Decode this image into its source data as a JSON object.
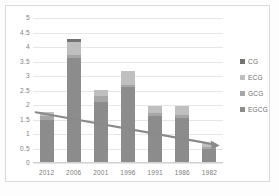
{
  "chart_data": {
    "type": "bar",
    "stacked": true,
    "title": "",
    "xlabel": "",
    "ylabel": "",
    "categories": [
      "2012",
      "2006",
      "2001",
      "1996",
      "1991",
      "1986",
      "1982"
    ],
    "series": [
      {
        "name": "EGCG",
        "color": "#8c8c8c",
        "values": [
          1.5,
          3.62,
          2.12,
          2.62,
          1.62,
          1.55,
          0.47
        ]
      },
      {
        "name": "GCG",
        "color": "#a6a6a6",
        "values": [
          0.12,
          0.12,
          0.18,
          0.08,
          0.1,
          0.12,
          0.08
        ]
      },
      {
        "name": "ECG",
        "color": "#bfbfbf",
        "values": [
          0.15,
          0.45,
          0.22,
          0.46,
          0.26,
          0.28,
          0.14
        ]
      },
      {
        "name": "CG",
        "color": "#737373",
        "values": [
          0.0,
          0.08,
          0.0,
          0.0,
          0.0,
          0.0,
          0.0
        ]
      }
    ],
    "totals": [
      1.77,
      4.27,
      2.52,
      3.16,
      1.98,
      1.95,
      0.69
    ],
    "ylim": [
      0,
      5
    ],
    "yticks": [
      "0",
      "0.5",
      "1",
      "1.5",
      "2",
      "2.5",
      "3",
      "3.5",
      "4",
      "4.5",
      "5"
    ],
    "ytick_values": [
      0,
      0.5,
      1,
      1.5,
      2,
      2.5,
      3,
      3.5,
      4,
      4.5,
      5
    ],
    "grid": true,
    "legend_position": "right",
    "legend": [
      {
        "label": "CG",
        "color": "#737373"
      },
      {
        "label": "ECG",
        "color": "#bfbfbf"
      },
      {
        "label": "GCG",
        "color": "#a6a6a6"
      },
      {
        "label": "EGCG",
        "color": "#8c8c8c"
      }
    ],
    "annotations": [
      {
        "type": "arrow",
        "name": "declining-trend-arrow",
        "color": "#8a8a8a",
        "from": {
          "x": "2012",
          "y": 1.75
        },
        "to": {
          "x": "1982",
          "y": 0.6
        }
      }
    ]
  },
  "footnote": "",
  "colors": {
    "grid": "#e6e6e6",
    "frame": "#d9d9d9",
    "tick_text": "#808080",
    "arrow": "#8a8a8a"
  }
}
